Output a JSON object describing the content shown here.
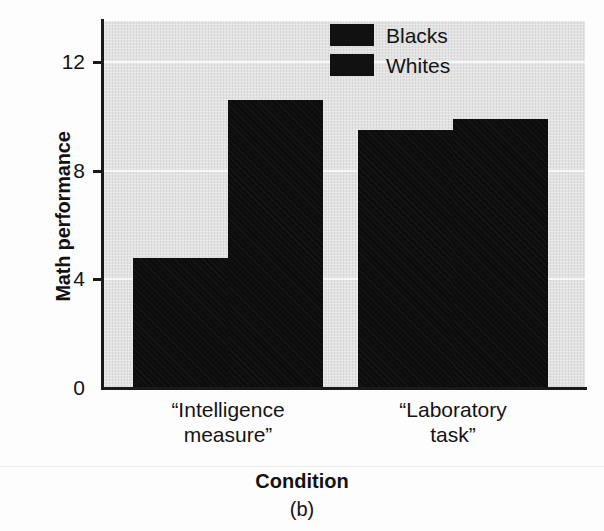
{
  "chart_data": {
    "type": "bar",
    "title": "",
    "subtitle": "",
    "xlabel": "Condition",
    "ylabel": "Math performance",
    "caption": "(b)",
    "categories": [
      "“Intelligence\nmeasure”",
      "“Laboratory\ntask”"
    ],
    "series": [
      {
        "name": "Blacks",
        "values": [
          4.8,
          9.5
        ],
        "color": "#0d0d0d"
      },
      {
        "name": "Whites",
        "values": [
          10.6,
          9.9
        ],
        "color": "#0d0d0d"
      }
    ],
    "ylim": [
      0,
      13.5
    ],
    "yticks": [
      0,
      4,
      8,
      12
    ],
    "ytick_labels": [
      "0",
      "4",
      "8",
      "12"
    ],
    "grid": true,
    "gridline_values": [
      4,
      8,
      12
    ],
    "gridline_color": "#f7f7f7",
    "plot_background": "#e2e2e2",
    "axis_color": "#1a1a1a",
    "legend_position": "top-right",
    "legend_entries": [
      "Blacks",
      "Whites"
    ]
  }
}
